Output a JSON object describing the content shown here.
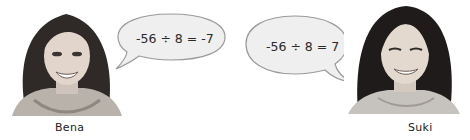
{
  "people": [
    {
      "name": "Bena",
      "statement": "-56 ÷ 8 = -7"
    },
    {
      "name": "Suki",
      "statement": "-56 ÷ 8 = 7"
    }
  ],
  "colors": {
    "bubble_fill": "#efefef",
    "bubble_stroke": "#9a9a9a",
    "text": "#2a2a2a"
  }
}
